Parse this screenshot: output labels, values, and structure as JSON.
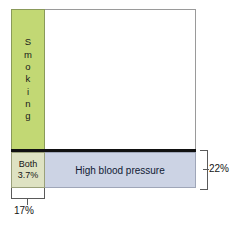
{
  "diagram": {
    "type": "proportional-area-venn",
    "smoking": {
      "label": "Smoking",
      "letters": [
        "S",
        "m",
        "o",
        "k",
        "i",
        "n",
        "g"
      ],
      "color": "#c2d874",
      "value_percent": 17,
      "value_label": "17%"
    },
    "high_blood_pressure": {
      "label": "High blood pressure",
      "color": "#ccd3e4",
      "value_percent": 22,
      "value_label": "22%"
    },
    "both": {
      "label": "Both",
      "value_label": "3.7%",
      "color": "#dee2c2",
      "value_percent": 3.7
    },
    "brackets": {
      "bottom_label": "17%",
      "right_label": "22%"
    }
  },
  "chart_data": {
    "type": "bar",
    "title": "",
    "categories": [
      "Smoking",
      "High blood pressure",
      "Both"
    ],
    "values": [
      17,
      22,
      3.7
    ],
    "xlabel": "",
    "ylabel": "",
    "ylim": [
      0,
      25
    ]
  }
}
